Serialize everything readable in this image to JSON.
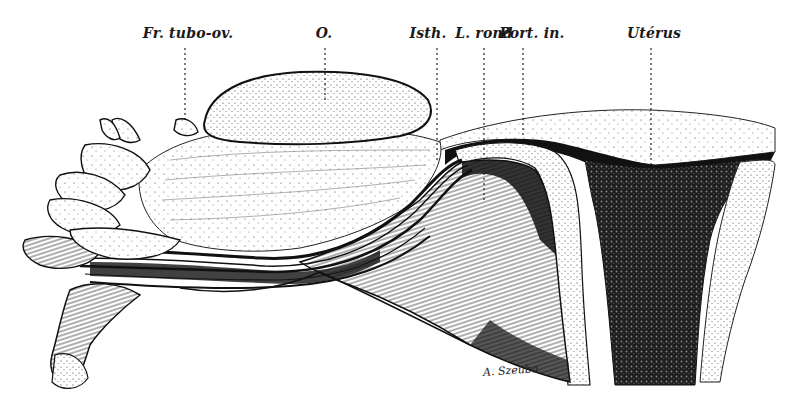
{
  "figure": {
    "labels": [
      {
        "id": "fr-tubo-ov",
        "text": "Fr. tubo-ov.",
        "x": 188,
        "leader_x": 185,
        "leader_end_y": 120
      },
      {
        "id": "ovary",
        "text": "O.",
        "x": 324,
        "leader_x": 325,
        "leader_end_y": 100
      },
      {
        "id": "isthmus",
        "text": "Isth.",
        "x": 432,
        "leader_x": 437,
        "leader_end_y": 160
      },
      {
        "id": "ligament-rond",
        "text": "L. rond",
        "x": 484,
        "leader_x": 484,
        "leader_end_y": 200
      },
      {
        "id": "portion-interstitielle",
        "text": "Port. in.",
        "x": 530,
        "leader_x": 523,
        "leader_end_y": 135
      },
      {
        "id": "uterus",
        "text": "Utérus",
        "x": 654,
        "leader_x": 651,
        "leader_end_y": 165
      }
    ],
    "signature": "A. Szeuba",
    "colors": {
      "ink": "#111111",
      "paper": "#ffffff",
      "shade": "#2a2a2a"
    }
  }
}
